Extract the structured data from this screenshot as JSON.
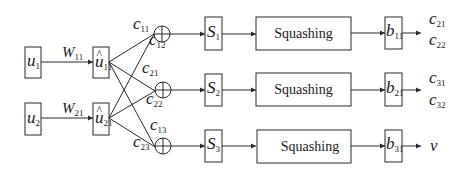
{
  "diagram": {
    "type": "capsule-network-dynamic-routing",
    "inputs": [
      {
        "symbol": "u",
        "sub": "1"
      },
      {
        "symbol": "u",
        "sub": "2"
      }
    ],
    "weights": [
      {
        "symbol": "W",
        "sub": "11"
      },
      {
        "symbol": "W",
        "sub": "21"
      }
    ],
    "predictions": [
      {
        "symbol": "u",
        "hat": "^",
        "sub": "11"
      },
      {
        "symbol": "u",
        "hat": "^",
        "sub": "21"
      }
    ],
    "coupling_coefficients": [
      {
        "symbol": "c",
        "sub": "11"
      },
      {
        "symbol": "c",
        "sub": "12"
      },
      {
        "symbol": "c",
        "sub": "21"
      },
      {
        "symbol": "c",
        "sub": "22"
      },
      {
        "symbol": "c",
        "sub": "13"
      },
      {
        "symbol": "c",
        "sub": "23"
      }
    ],
    "sum_nodes": [
      "sum-1",
      "sum-2",
      "sum-3"
    ],
    "weighted_sums": [
      {
        "symbol": "S",
        "sub": "1"
      },
      {
        "symbol": "S",
        "sub": "2"
      },
      {
        "symbol": "S",
        "sub": "3"
      }
    ],
    "squashing": [
      "Squashing",
      "Squashing",
      "Squashing"
    ],
    "logits": [
      {
        "symbol": "b",
        "sub": "11"
      },
      {
        "symbol": "b",
        "sub": "21"
      },
      {
        "symbol": "b",
        "sub": "31"
      }
    ],
    "outputs": [
      [
        {
          "symbol": "c",
          "sub": "21"
        },
        {
          "symbol": "c",
          "sub": "22"
        }
      ],
      [
        {
          "symbol": "c",
          "sub": "31"
        },
        {
          "symbol": "c",
          "sub": "32"
        }
      ],
      [
        {
          "symbol": "v",
          "sub": ""
        }
      ]
    ]
  }
}
